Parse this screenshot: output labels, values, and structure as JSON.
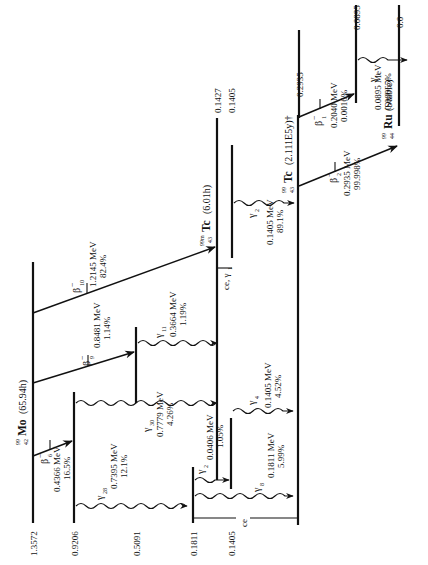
{
  "nuclides": {
    "parent": {
      "mass": "99",
      "z": "42",
      "symbol": "Mo",
      "halflife": "(65.94h)"
    },
    "metastable": {
      "mass": "99m",
      "z": "43",
      "symbol": "Tc",
      "halflife": "(6.01h)"
    },
    "daughter": {
      "mass": "99",
      "z": "43",
      "symbol": "Tc",
      "halflife": "(2.111E5y)†"
    },
    "stable": {
      "mass": "99",
      "z": "44",
      "symbol": "Ru",
      "halflife": "(Stable)"
    }
  },
  "levels": {
    "mo_1_3572": "1.3572",
    "mo_0_9206": "0.9206",
    "mo_0_5091": "0.5091",
    "mo_0_1811": "0.1811",
    "mo_0_1405": "0.1405",
    "tc_0_1427": "0.1427",
    "tc_0_1405": "0.1405",
    "tc99_0_2935": "0.2935",
    "ru_0_0895": "0.0895",
    "ru_0_0": "0.0"
  },
  "transitions": {
    "beta6": {
      "symbol": "β",
      "sup": "−",
      "sub": "6",
      "energy": "0.4366 MeV",
      "intensity": "16.5%"
    },
    "beta9": {
      "symbol": "β",
      "sup": "−",
      "sub": "9",
      "energy": "0.8481 MeV",
      "intensity": "1.14%"
    },
    "beta10": {
      "symbol": "β",
      "sup": "−",
      "sub": "10",
      "energy": "1.2145 MeV",
      "intensity": "82.4%"
    },
    "gamma28": {
      "symbol": "γ",
      "sub": "28",
      "energy": "0.7395 MeV",
      "intensity": "12.1%"
    },
    "gamma30": {
      "symbol": "γ",
      "sub": "30",
      "energy": "0.7779 MeV",
      "intensity": "4.26%"
    },
    "gamma11": {
      "symbol": "γ",
      "sub": "11",
      "energy": "0.3664 MeV",
      "intensity": "1.19%"
    },
    "gamma2a": {
      "symbol": "γ",
      "sub": "2",
      "energy": "0.0406 MeV",
      "intensity": "1.05%"
    },
    "gamma8": {
      "symbol": "γ",
      "sub": "8",
      "energy": "0.1811 MeV",
      "intensity": "5.99%"
    },
    "gamma4": {
      "symbol": "γ",
      "sub": "4",
      "energy": "0.1405 MeV",
      "intensity": "4.52%"
    },
    "gamma2b": {
      "symbol": "γ",
      "sub": "2",
      "energy": "0.1405 MeV",
      "intensity": "89.1%"
    },
    "ce_gamma1": {
      "label": "ce, γ",
      "sub": "1"
    },
    "ce": {
      "label": "ce"
    },
    "beta2": {
      "symbol": "β",
      "sup": "−",
      "sub": "2",
      "energy": "0.2935 MeV",
      "intensity": "99.998%"
    },
    "beta1": {
      "symbol": "β",
      "sup": "−",
      "sub": "1",
      "energy": "0.2040 MeV",
      "intensity": "0.0016%"
    },
    "gamma1": {
      "symbol": "γ",
      "sub": "1",
      "energy": "0.0895 MeV",
      "intensity": "0.00065%"
    }
  }
}
